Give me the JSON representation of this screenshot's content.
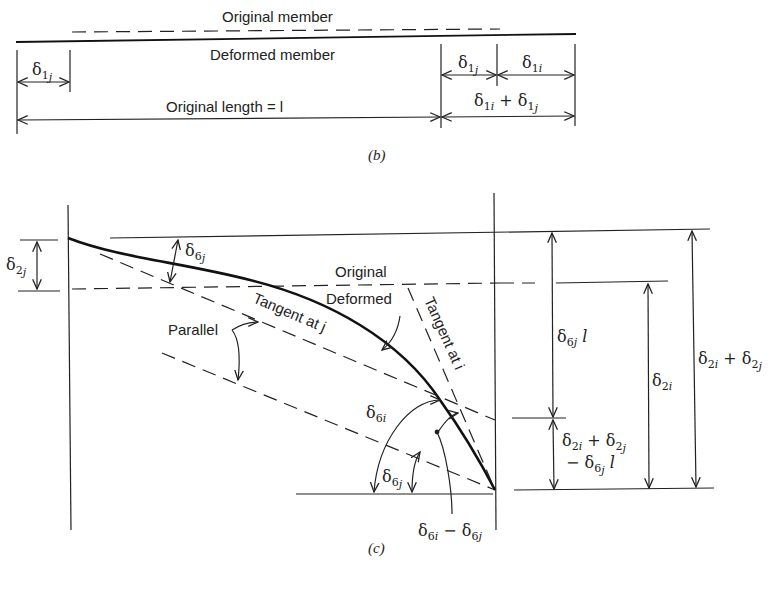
{
  "figure_b": {
    "caption": "(b)",
    "labels": {
      "original_member": "Original member",
      "deformed_member": "Deformed member",
      "original_length": "Original length = l",
      "delta_1j_left": "δ1j",
      "delta_1j_right": "δ1j",
      "delta_1i": "δ1i",
      "delta_sum": "δ1i + δ1j"
    }
  },
  "figure_c": {
    "caption": "(c)",
    "labels": {
      "delta_2j": "δ2j",
      "delta_6j_top": "δ6j",
      "original": "Original",
      "deformed": "Deformed",
      "tangent_j": "Tangent at j",
      "tangent_i": "Tangent at i",
      "parallel": "Parallel",
      "delta_6i": "δ6i",
      "delta_6j_bottom": "δ6j",
      "delta_diff": "δ6i − δ6j",
      "delta_6j_l": "δ6j l",
      "delta_2i": "δ2i",
      "delta_2i_plus_2j": "δ2i + δ2j",
      "remainder_line1": "δ2i + δ2j",
      "remainder_line2": "− δ6j l"
    }
  }
}
